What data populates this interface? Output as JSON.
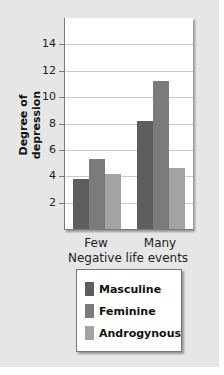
{
  "chart_data": {
    "type": "bar",
    "title": "",
    "xlabel": "Negative life events",
    "ylabel": "Degree of depression",
    "categories": [
      "Few",
      "Many"
    ],
    "series": [
      {
        "name": "Masculine",
        "values": [
          3.8,
          8.2
        ],
        "color": "#5e5e5e"
      },
      {
        "name": "Feminine",
        "values": [
          5.3,
          11.2
        ],
        "color": "#7b7b7b"
      },
      {
        "name": "Androgynous",
        "values": [
          4.2,
          4.6
        ],
        "color": "#a3a3a3"
      }
    ],
    "ylim": [
      0,
      16
    ],
    "yticks": [
      2,
      4,
      6,
      8,
      10,
      12,
      14
    ],
    "grid": true,
    "legend_position": "bottom"
  }
}
